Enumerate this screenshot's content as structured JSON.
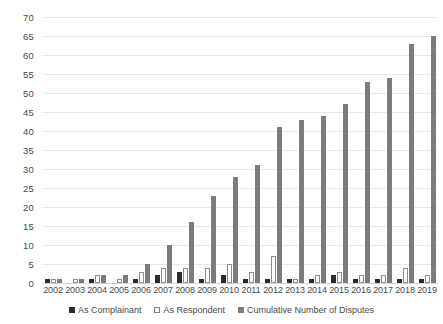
{
  "chart_data": {
    "type": "bar",
    "title": "",
    "xlabel": "",
    "ylabel": "",
    "ylim": [
      0,
      70
    ],
    "ytick_step": 5,
    "grid": true,
    "legend_position": "bottom",
    "categories": [
      "2002",
      "2003",
      "2004",
      "2005",
      "2006",
      "2007",
      "2008",
      "2009",
      "2010",
      "2011",
      "2012",
      "2013",
      "2014",
      "2015",
      "2016",
      "2017",
      "2018",
      "2019"
    ],
    "series": [
      {
        "name": "As Complainant",
        "color": "#2b2b2b",
        "values": [
          1,
          0,
          1,
          0,
          1,
          2,
          3,
          1,
          2,
          1,
          1,
          1,
          1,
          2,
          1,
          1,
          1,
          1
        ]
      },
      {
        "name": "As Respondent",
        "color": "#fbfbfb",
        "values": [
          1,
          1,
          2,
          1,
          3,
          4,
          4,
          4,
          5,
          3,
          7,
          1,
          2,
          3,
          2,
          2,
          4,
          2
        ]
      },
      {
        "name": "Cumulative Number of Disputes",
        "color": "#7c7c7c",
        "values": [
          1,
          1,
          2,
          2,
          5,
          10,
          16,
          23,
          28,
          31,
          41,
          43,
          44,
          47,
          53,
          54,
          63,
          65
        ]
      }
    ],
    "ytick_labels": [
      "0",
      "5",
      "10",
      "15",
      "20",
      "25",
      "30",
      "35",
      "40",
      "45",
      "50",
      "55",
      "60",
      "65",
      "70"
    ]
  }
}
